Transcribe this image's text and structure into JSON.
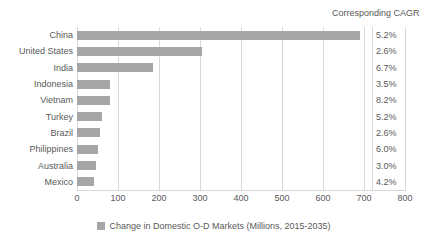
{
  "chart_data": {
    "type": "bar",
    "orientation": "horizontal",
    "title": "",
    "xlabel": "",
    "ylabel": "",
    "xlim": [
      0,
      800
    ],
    "xticks": [
      0,
      100,
      200,
      300,
      400,
      500,
      600,
      700,
      800
    ],
    "grid": true,
    "legend_position": "bottom",
    "categories": [
      "China",
      "United States",
      "India",
      "Indonesia",
      "Vietnam",
      "Turkey",
      "Brazil",
      "Philippines",
      "Australia",
      "Mexico"
    ],
    "series": [
      {
        "name": "Change in Domestic O-D Markets (Millions, 2015-2035)",
        "color": "#a6a6a6",
        "values": [
          690,
          305,
          186,
          80,
          80,
          62,
          56,
          52,
          47,
          42
        ]
      }
    ],
    "annotations": {
      "column_header": "Corresponding CAGR",
      "column_values": [
        "5.2%",
        "2.6%",
        "6.7%",
        "3.5%",
        "8.2%",
        "5.2%",
        "2.6%",
        "6.0%",
        "3.0%",
        "4.2%"
      ]
    }
  },
  "legend": {
    "label": "Change in Domestic O-D Markets (Millions, 2015-2035)"
  },
  "colors": {
    "bar": "#a6a6a6",
    "grid": "#d9d9d9",
    "text": "#595959",
    "background": "#ffffff"
  }
}
